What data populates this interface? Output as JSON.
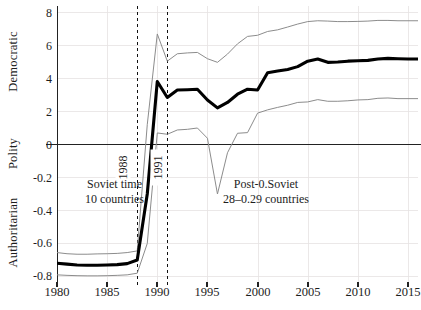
{
  "chart_data": {
    "type": "line",
    "title": "",
    "xlabel": "",
    "ylabel": "Polity",
    "axis_group_labels": [
      "Democratic",
      "Polity",
      "Authoritarian"
    ],
    "xlim": [
      1980,
      2016
    ],
    "ylim": [
      -0.85,
      8.6
    ],
    "grid": true,
    "legend_position": "none",
    "x_tick_labels": [
      "1980",
      "1985",
      "1990",
      "1995",
      "2000",
      "2005",
      "2010",
      "2015"
    ],
    "x_ticks": [
      1980,
      1985,
      1990,
      1995,
      2000,
      2005,
      2010,
      2015
    ],
    "y_tick_labels": [
      "8",
      "6",
      "4",
      "2",
      "0",
      "-0.2",
      "-0.4",
      "-0.6",
      "-0.8"
    ],
    "y_ticks": [
      8,
      6,
      4,
      2,
      0,
      -0.2,
      -0.4,
      -0.6,
      -0.8
    ],
    "zero_line": 0,
    "annotations": [
      {
        "name": "soviet-era-note",
        "line1": "Soviet time",
        "line2": "10 countries"
      },
      {
        "name": "post-soviet-note",
        "line1": "Post-0.Soviet",
        "line2": "28–0.29 countries"
      },
      {
        "name": "vline-1988-label",
        "text": "1988",
        "x": 1988
      },
      {
        "name": "vline-1991-label",
        "text": "1991",
        "x": 1991
      }
    ],
    "vertical_reference_lines": [
      1988,
      1991
    ],
    "x": [
      1980,
      1981,
      1982,
      1983,
      1984,
      1985,
      1986,
      1987,
      1988,
      1989,
      1990,
      1991,
      1992,
      1993,
      1994,
      1995,
      1996,
      1997,
      1998,
      1999,
      2000,
      2001,
      2002,
      2003,
      2004,
      2005,
      2006,
      2007,
      2008,
      2009,
      2010,
      2011,
      2012,
      2013,
      2014,
      2015,
      2016
    ],
    "series": [
      {
        "name": "mean-polity",
        "style": "bold-black",
        "color": "#000000",
        "width": 3.1,
        "values": [
          -0.72,
          -0.725,
          -0.73,
          -0.732,
          -0.732,
          -0.73,
          -0.728,
          -0.722,
          -0.7,
          -0.3,
          3.82,
          2.85,
          3.3,
          3.32,
          3.35,
          2.7,
          2.22,
          2.55,
          3.05,
          3.35,
          3.3,
          4.35,
          4.45,
          4.55,
          4.72,
          5.05,
          5.18,
          4.98,
          5.0,
          5.05,
          5.08,
          5.1,
          5.18,
          5.22,
          5.2,
          5.18,
          5.18
        ]
      },
      {
        "name": "upper-confidence-bound",
        "style": "thin-gray",
        "color": "#8c8c8c",
        "width": 1.0,
        "values": [
          -0.655,
          -0.662,
          -0.665,
          -0.665,
          -0.663,
          -0.662,
          -0.66,
          -0.655,
          -0.645,
          1.2,
          6.7,
          5.05,
          5.5,
          5.55,
          5.58,
          5.2,
          4.98,
          5.48,
          6.1,
          6.55,
          6.62,
          6.85,
          6.95,
          7.12,
          7.3,
          7.45,
          7.5,
          7.48,
          7.45,
          7.45,
          7.46,
          7.48,
          7.52,
          7.52,
          7.5,
          7.5,
          7.5
        ]
      },
      {
        "name": "lower-confidence-bound",
        "style": "thin-gray",
        "color": "#8c8c8c",
        "width": 1.0,
        "values": [
          -0.79,
          -0.793,
          -0.795,
          -0.796,
          -0.796,
          -0.795,
          -0.793,
          -0.79,
          -0.78,
          -0.6,
          0.7,
          0.62,
          0.88,
          0.92,
          1.0,
          0.38,
          -0.3,
          -0.05,
          0.68,
          0.72,
          1.9,
          2.1,
          2.25,
          2.38,
          2.55,
          2.58,
          2.72,
          2.62,
          2.62,
          2.65,
          2.7,
          2.72,
          2.8,
          2.82,
          2.78,
          2.78,
          2.78
        ]
      }
    ]
  }
}
